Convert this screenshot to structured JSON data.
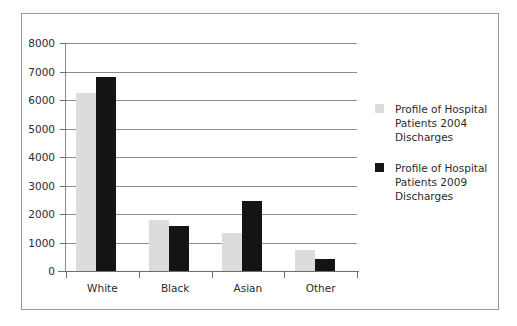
{
  "chart_data": {
    "type": "bar",
    "title": "",
    "xlabel": "",
    "ylabel": "",
    "categories": [
      "White",
      "Black",
      "Asian",
      "Other"
    ],
    "ylim": [
      0,
      8000
    ],
    "ytick_step": 1000,
    "yticks": [
      "8000",
      "7000",
      "6000",
      "5000",
      "4000",
      "3000",
      "2000",
      "1000",
      "0"
    ],
    "grid": true,
    "legend_position": "right",
    "series": [
      {
        "name": "Profile of Hospital Patients 2004 Discharges",
        "color": "#dcdcdc",
        "values": [
          6250,
          1800,
          1350,
          750
        ]
      },
      {
        "name": "Profile of Hospital Patients 2009 Discharges",
        "color": "#141414",
        "values": [
          6800,
          1570,
          2450,
          430
        ]
      }
    ]
  },
  "legend": {
    "entries": [
      {
        "label": "Profile of Hospital Patients 2004 Discharges",
        "swatch": "#dcdcdc"
      },
      {
        "label": "Profile of Hospital Patients 2009 Discharges",
        "swatch": "#141414"
      }
    ]
  },
  "frame": {
    "border_color": "#9a9a9a",
    "background": "#ffffff"
  }
}
